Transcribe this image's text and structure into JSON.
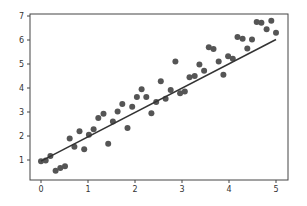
{
  "chart_data": {
    "type": "scatter",
    "title": "",
    "xlabel": "",
    "ylabel": "",
    "xlim": [
      -0.25,
      5.25
    ],
    "ylim": [
      0.2,
      7.15
    ],
    "grid": false,
    "legend": null,
    "xticks": [
      0,
      1,
      2,
      3,
      4,
      5
    ],
    "yticks": [
      1,
      2,
      3,
      4,
      5,
      6,
      7
    ],
    "series": [
      {
        "name": "data",
        "kind": "scatter",
        "color": "#555555",
        "x": [
          0.0,
          0.1,
          0.2,
          0.31,
          0.41,
          0.51,
          0.61,
          0.71,
          0.82,
          0.92,
          1.02,
          1.12,
          1.22,
          1.33,
          1.43,
          1.53,
          1.63,
          1.73,
          1.84,
          1.94,
          2.04,
          2.14,
          2.24,
          2.35,
          2.45,
          2.55,
          2.65,
          2.76,
          2.86,
          2.96,
          3.06,
          3.16,
          3.27,
          3.37,
          3.47,
          3.57,
          3.67,
          3.78,
          3.88,
          3.98,
          4.08,
          4.18,
          4.29,
          4.39,
          4.49,
          4.59,
          4.69,
          4.8,
          4.9,
          5.0
        ],
        "y": [
          0.95,
          0.98,
          1.17,
          0.55,
          0.67,
          0.74,
          1.9,
          1.55,
          2.2,
          1.45,
          2.05,
          2.28,
          2.75,
          2.93,
          1.68,
          2.6,
          3.02,
          3.33,
          2.33,
          3.22,
          3.62,
          3.95,
          3.62,
          2.95,
          3.42,
          4.28,
          3.55,
          3.92,
          5.1,
          3.78,
          3.86,
          4.45,
          4.5,
          4.98,
          4.72,
          5.7,
          5.62,
          5.1,
          4.55,
          5.32,
          5.22,
          6.12,
          6.05,
          5.65,
          6.02,
          6.75,
          6.72,
          6.45,
          6.8,
          6.3
        ]
      },
      {
        "name": "fit",
        "kind": "line",
        "color": "#333333",
        "x": [
          0,
          5
        ],
        "y": [
          0.95,
          6.02
        ]
      }
    ]
  },
  "axes": {
    "x_tick_labels": [
      "0",
      "1",
      "2",
      "3",
      "4",
      "5"
    ],
    "y_tick_labels": [
      "1",
      "2",
      "3",
      "4",
      "5",
      "6",
      "7"
    ]
  }
}
